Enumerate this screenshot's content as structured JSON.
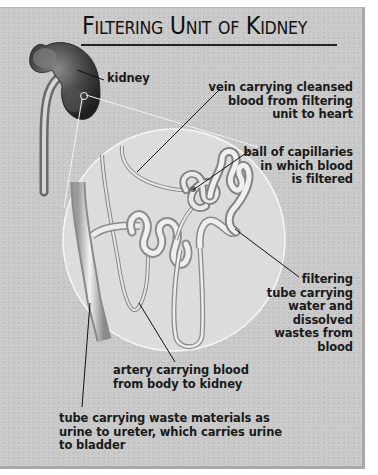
{
  "title": "Filtering Unit of Kidney",
  "labels": {
    "kidney": "kidney",
    "vein": "vein carrying cleansed\nblood from filtering\nunit to heart",
    "capillaries": "ball of capillaries\nin which blood\nis filtered",
    "filtering_tube": "filtering\ntube carrying\nwater and\ndissolved\nwastes from\nblood",
    "artery": "artery carrying blood\nfrom body to kidney",
    "collecting_tube": "tube carrying waste materials as\nurine to ureter, which carries urine\nto bladder"
  },
  "colors": {
    "background": "#c9c9c9",
    "magnified_circle": "#dcdcdc",
    "kidney": "#3a3a3a",
    "text": "#1a1a1a"
  }
}
